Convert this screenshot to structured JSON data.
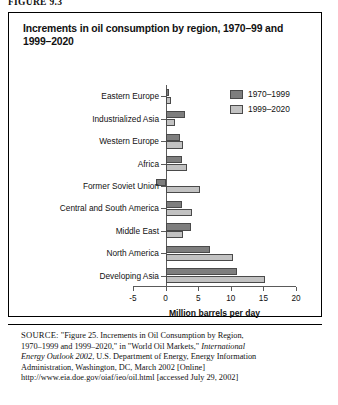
{
  "figure_number": "FIGURE 9.3",
  "chart": {
    "title": "Increments in oil consumption by region, 1970–99 and 1999–2020",
    "legend": [
      {
        "label": "1970–1999",
        "color": "#7e7e7e"
      },
      {
        "label": "1999–2020",
        "color": "#c2c2c2"
      }
    ]
  },
  "source": {
    "label": "SOURCE:",
    "line1": "\"Figure 25. Increments in Oil Consumption by Region,",
    "line2a": "1970–1999 and 1999–2020,\" in \"World Oil Markets,\" ",
    "line2b_italic": "International",
    "line3a_italic": "Energy Outlook 2002",
    "line3b": ", U.S. Department of Energy, Energy Information",
    "line4": "Administration, Washington, DC, March 2002  [Online]",
    "line5": "http://www.eia.doe.gov/oiaf/ieo/oil.html [accessed July 29, 2002]"
  },
  "chart_data": {
    "type": "bar",
    "orientation": "horizontal",
    "title": "Increments in oil consumption by region, 1970–99 and 1999–2020",
    "xlabel": "Million barrels per day",
    "ylabel": "",
    "xlim": [
      -5,
      20
    ],
    "xticks": [
      -5,
      0,
      5,
      10,
      15,
      20
    ],
    "xtick_labels": [
      "-5",
      "0",
      "5",
      "10",
      "15",
      "20"
    ],
    "grid": false,
    "legend_position": "top-right",
    "categories": [
      "Eastern Europe",
      "Industrialized Asia",
      "Western Europe",
      "Africa",
      "Former Soviet Union",
      "Central and South America",
      "Middle East",
      "North America",
      "Developing Asia"
    ],
    "series": [
      {
        "name": "1970–1999",
        "color": "#7e7e7e",
        "values": [
          0.5,
          3.0,
          2.2,
          2.5,
          -1.5,
          2.5,
          3.9,
          6.8,
          11.0
        ]
      },
      {
        "name": "1999–2020",
        "color": "#c2c2c2",
        "values": [
          0.9,
          1.4,
          2.6,
          3.3,
          5.3,
          4.0,
          2.7,
          10.3,
          15.3
        ]
      }
    ]
  }
}
